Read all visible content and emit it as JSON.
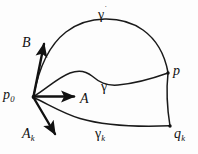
{
  "figure": {
    "background_color": "#fdfdfd",
    "stroke_color": "#1a1a1a",
    "width": 198,
    "height": 154
  },
  "labels": {
    "base_point": "p",
    "base_point_sub": "0",
    "vector_B": "B",
    "vector_A": "A",
    "vector_Ak": "A",
    "vector_Ak_sub": "k",
    "curve_outer": "γ",
    "curve_outer_mark": "˙",
    "curve_middle": "γ",
    "curve_lower": "γ",
    "curve_lower_sub": "k",
    "endpoint_p": "p",
    "endpoint_q": "q",
    "endpoint_q_sub": "k"
  },
  "geometry": {
    "origin_point": {
      "x": 33,
      "y": 97
    },
    "endpoint_p": {
      "x": 168,
      "y": 73
    },
    "endpoint_qk": {
      "x": 170,
      "y": 126
    },
    "vectors": [
      {
        "name": "B",
        "from": {
          "x": 33,
          "y": 97
        },
        "to": {
          "x": 44,
          "y": 41
        }
      },
      {
        "name": "A",
        "from": {
          "x": 33,
          "y": 97
        },
        "to": {
          "x": 76,
          "y": 97
        }
      },
      {
        "name": "Ak",
        "from": {
          "x": 33,
          "y": 97
        },
        "to": {
          "x": 57,
          "y": 136
        }
      }
    ],
    "curves": [
      {
        "name": "gamma-dot",
        "description": "outer arc from p0 over top to p"
      },
      {
        "name": "gamma",
        "description": "wavy middle curve from p0 to p"
      },
      {
        "name": "gamma-k",
        "description": "lower sagging curve from p0 to q_k"
      },
      {
        "name": "side-edge",
        "description": "near-vertical edge from p to q_k"
      }
    ]
  }
}
